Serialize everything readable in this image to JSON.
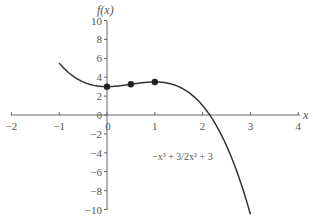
{
  "chart_data": {
    "type": "line",
    "title": "",
    "xlabel": "x",
    "ylabel": "f(x)",
    "xlim": [
      -2,
      4
    ],
    "ylim": [
      -10,
      10
    ],
    "grid": false,
    "x_ticks": [
      "−2",
      "−1",
      "0",
      "1",
      "2",
      "3",
      "4"
    ],
    "y_ticks": [
      "10",
      "8",
      "6",
      "4",
      "2",
      "0",
      "−2",
      "−4",
      "−6",
      "−8",
      "−10"
    ],
    "series": [
      {
        "name": "−x³ + 3/2x² + 3",
        "function": "-x^3 + 1.5*x^2 + 3",
        "x_range": [
          -1,
          3
        ],
        "x": [
          -1,
          -0.5,
          0,
          0.5,
          1,
          1.5,
          2,
          2.5,
          3
        ],
        "values": [
          5.5,
          3.5,
          3,
          3.25,
          3.5,
          3,
          1,
          -3.25,
          -10.5
        ]
      }
    ],
    "highlighted_points": [
      {
        "x": 0,
        "y": 3
      },
      {
        "x": 0.5,
        "y": 3.25
      },
      {
        "x": 1,
        "y": 3.5
      }
    ],
    "annotations": [
      {
        "text": "−x³ + 3/2x² + 3",
        "x": 1.0,
        "y": -4.5
      }
    ],
    "colors": {
      "curve": "#333333",
      "axis": "#666666",
      "text": "#555555"
    }
  },
  "labels": {
    "x_axis_title": "x",
    "y_axis_title": "f(x)",
    "annotation": "−x³ + 3/2x² + 3"
  }
}
